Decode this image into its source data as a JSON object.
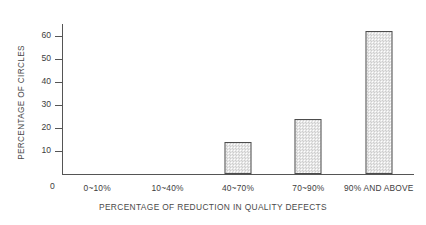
{
  "chart_data": {
    "type": "bar",
    "title": "",
    "xlabel": "PERCENTAGE OF REDUCTION IN QUALITY DEFECTS",
    "ylabel": "PERCENTAGE OF CIRCLES",
    "categories": [
      "0~10%",
      "10~40%",
      "40~70%",
      "70~90%",
      "90% AND ABOVE"
    ],
    "values": [
      0,
      0,
      14,
      24,
      62
    ],
    "ylim": [
      0,
      65
    ],
    "yticks": [
      10,
      20,
      30,
      40,
      50,
      60
    ],
    "ytick_labels": [
      "10",
      "20",
      "30",
      "40",
      "50",
      "60"
    ],
    "origin_label": "0",
    "grid": false,
    "legend": null,
    "bar_fill_color": "#f2f2f2",
    "bar_pattern_color": "#cdcdcd",
    "bar_border_color": "#4d4d4d",
    "axis_color": "#555555",
    "text_color": "#3d3d3d",
    "background_color": "#ffffff"
  }
}
